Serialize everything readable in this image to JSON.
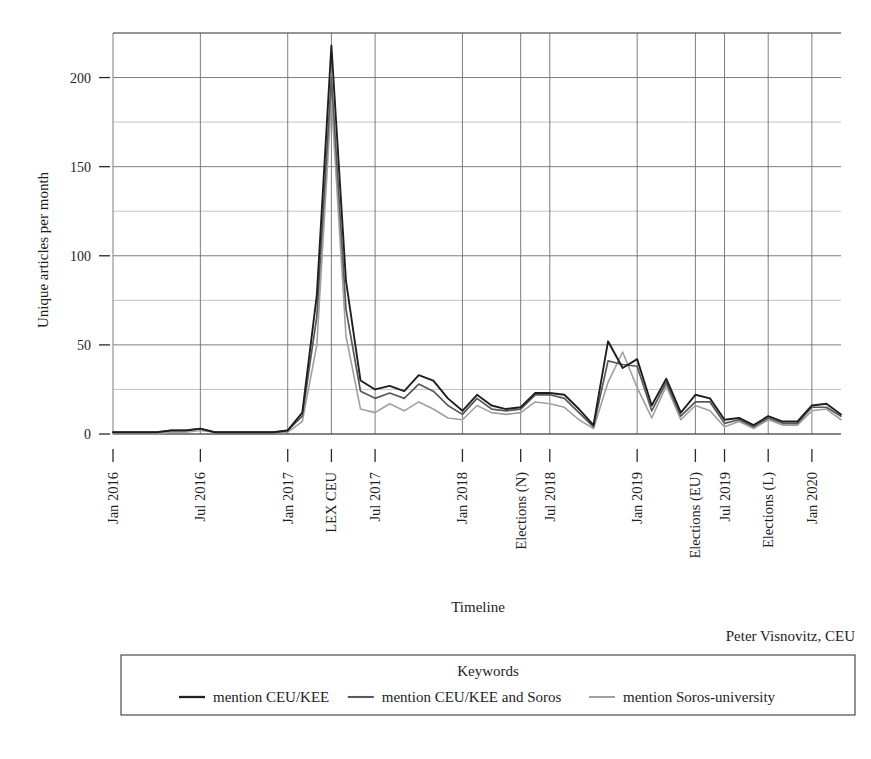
{
  "chart_data": {
    "type": "line",
    "title": "",
    "xlabel": "Timeline",
    "ylabel": "Unique articles per month",
    "ylim": [
      0,
      225
    ],
    "yticks": [
      0,
      50,
      100,
      150,
      200
    ],
    "yticklabels": [
      "0",
      "50",
      "100",
      "150",
      "200"
    ],
    "yminor": [
      25,
      75,
      125,
      175,
      225
    ],
    "grid": true,
    "legend_position": "below-plot",
    "legend_title": "Keywords",
    "attribution": "Peter Visnovitz, CEU",
    "xticklabels": [
      "Jan 2016",
      "Jul 2016",
      "Jan 2017",
      "LEX CEU",
      "Jul 2017",
      "Jan 2018",
      "Elections (N)",
      "Jul 2018",
      "Jan 2019",
      "Elections (EU)",
      "Jul 2019",
      "Elections (L)",
      "Jan 2020"
    ],
    "xtick_indices": [
      0,
      6,
      12,
      15,
      18,
      24,
      28,
      30,
      36,
      40,
      42,
      45,
      48
    ],
    "x": [
      "2016-01",
      "2016-02",
      "2016-03",
      "2016-04",
      "2016-05",
      "2016-06",
      "2016-07",
      "2016-08",
      "2016-09",
      "2016-10",
      "2016-11",
      "2016-12",
      "2017-01",
      "2017-02",
      "2017-03",
      "2017-04",
      "2017-05",
      "2017-06",
      "2017-07",
      "2017-08",
      "2017-09",
      "2017-10",
      "2017-11",
      "2017-12",
      "2018-01",
      "2018-02",
      "2018-03",
      "2018-04",
      "2018-05",
      "2018-06",
      "2018-07",
      "2018-08",
      "2018-09",
      "2018-10",
      "2018-11",
      "2018-12",
      "2019-01",
      "2019-02",
      "2019-03",
      "2019-04",
      "2019-05",
      "2019-06",
      "2019-07",
      "2019-08",
      "2019-09",
      "2019-10",
      "2019-11",
      "2019-12",
      "2020-01",
      "2020-02",
      "2020-03"
    ],
    "series": [
      {
        "name": "mention CEU/KEE",
        "color": "#1f1f1f",
        "width": 1.9,
        "values": [
          1,
          1,
          1,
          1,
          2,
          2,
          3,
          1,
          1,
          1,
          1,
          1,
          2,
          12,
          78,
          218,
          86,
          30,
          25,
          27,
          24,
          33,
          30,
          20,
          13,
          22,
          16,
          14,
          15,
          23,
          23,
          22,
          14,
          5,
          52,
          37,
          42,
          16,
          31,
          12,
          22,
          20,
          8,
          9,
          5,
          10,
          7,
          7,
          16,
          17,
          11
        ]
      },
      {
        "name": "mention CEU/KEE and Soros",
        "color": "#595959",
        "width": 1.7,
        "values": [
          1,
          1,
          1,
          1,
          2,
          2,
          3,
          1,
          1,
          1,
          1,
          1,
          2,
          10,
          66,
          200,
          70,
          24,
          20,
          23,
          20,
          28,
          24,
          16,
          11,
          20,
          14,
          13,
          14,
          22,
          22,
          20,
          12,
          4,
          41,
          39,
          38,
          13,
          29,
          10,
          18,
          18,
          6,
          8,
          4,
          9,
          6,
          6,
          15,
          15,
          10
        ]
      },
      {
        "name": "mention Soros-university",
        "color": "#a0a0a0",
        "width": 1.6,
        "values": [
          0,
          0,
          0,
          0,
          1,
          1,
          2,
          1,
          1,
          1,
          1,
          1,
          1,
          7,
          50,
          188,
          55,
          14,
          12,
          17,
          13,
          18,
          14,
          9,
          8,
          16,
          12,
          11,
          12,
          18,
          17,
          15,
          8,
          3,
          29,
          46,
          26,
          9,
          27,
          8,
          16,
          13,
          4,
          7,
          3,
          8,
          5,
          5,
          13,
          14,
          8
        ]
      }
    ]
  }
}
